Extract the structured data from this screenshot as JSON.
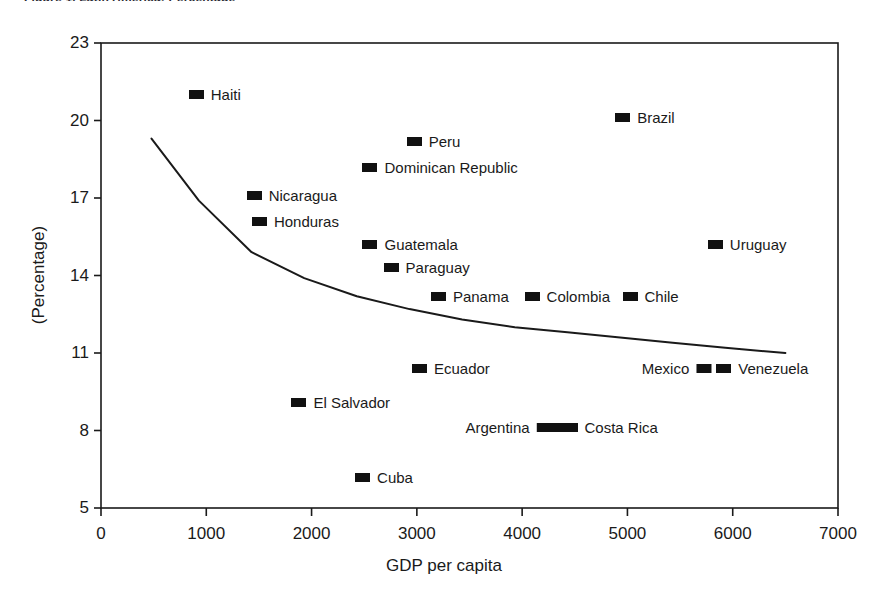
{
  "figure": {
    "caption": "Figure 1.   Latin America:   Percentage"
  },
  "chart_data": {
    "type": "scatter",
    "title": "",
    "xlabel": "GDP per capita",
    "ylabel": "(Percentage)",
    "xlim": [
      0,
      7000
    ],
    "ylim": [
      5,
      23
    ],
    "xticks": [
      "0",
      "1000",
      "2000",
      "3000",
      "4000",
      "5000",
      "6000",
      "7000"
    ],
    "xtick_values": [
      0,
      1000,
      2000,
      3000,
      4000,
      5000,
      6000,
      7000
    ],
    "yticks": [
      "23",
      "20",
      "17",
      "14",
      "11",
      "8",
      "5"
    ],
    "ytick_values": [
      23,
      20,
      17,
      14,
      11,
      8,
      5
    ],
    "grid": false,
    "legend": "none",
    "marker_color": "#111111",
    "line_color": "#1a1a1a",
    "points": [
      {
        "label": "Haiti",
        "x": 900,
        "y": 21.0,
        "label_side": "right"
      },
      {
        "label": "Brazil",
        "x": 4950,
        "y": 20.1,
        "label_side": "right"
      },
      {
        "label": "Peru",
        "x": 2970,
        "y": 19.2,
        "label_side": "right"
      },
      {
        "label": "Dominican Republic",
        "x": 2550,
        "y": 18.2,
        "label_side": "right"
      },
      {
        "label": "Nicaragua",
        "x": 1450,
        "y": 17.1,
        "label_side": "right"
      },
      {
        "label": "Honduras",
        "x": 1500,
        "y": 16.1,
        "label_side": "right"
      },
      {
        "label": "Guatemala",
        "x": 2550,
        "y": 15.2,
        "label_side": "right"
      },
      {
        "label": "Uruguay",
        "x": 5830,
        "y": 15.2,
        "label_side": "right"
      },
      {
        "label": "Paraguay",
        "x": 2750,
        "y": 14.3,
        "label_side": "right"
      },
      {
        "label": "Panama",
        "x": 3200,
        "y": 13.2,
        "label_side": "right"
      },
      {
        "label": "Colombia",
        "x": 4090,
        "y": 13.2,
        "label_side": "right"
      },
      {
        "label": "Chile",
        "x": 5020,
        "y": 13.2,
        "label_side": "right"
      },
      {
        "label": "Ecuador",
        "x": 3020,
        "y": 10.4,
        "label_side": "right"
      },
      {
        "label": "Mexico",
        "x": 5730,
        "y": 10.4,
        "label_side": "left"
      },
      {
        "label": "Venezuela",
        "x": 5910,
        "y": 10.4,
        "label_side": "right"
      },
      {
        "label": "El Salvador",
        "x": 1875,
        "y": 9.1,
        "label_side": "right"
      },
      {
        "label": "Argentina",
        "x": 4280,
        "y": 8.1,
        "label_side": "left",
        "marker_wide": true
      },
      {
        "label": "Costa Rica",
        "x": 4450,
        "y": 8.1,
        "label_side": "right"
      },
      {
        "label": "Cuba",
        "x": 2480,
        "y": 6.2,
        "label_side": "right"
      }
    ],
    "fit_line": {
      "name": "fitted trend",
      "x": [
        480,
        930,
        1430,
        1930,
        2430,
        2930,
        3430,
        3930,
        4430,
        4930,
        5430,
        5930,
        6500
      ],
      "y": [
        19.3,
        16.9,
        14.9,
        13.9,
        13.2,
        12.7,
        12.3,
        12.0,
        11.8,
        11.6,
        11.4,
        11.2,
        11.0
      ]
    }
  }
}
